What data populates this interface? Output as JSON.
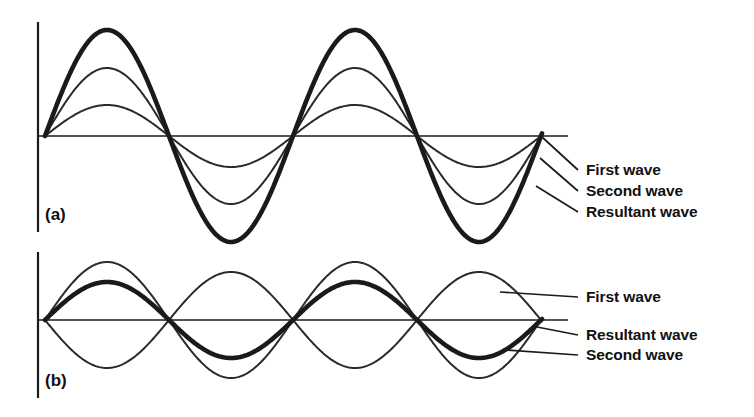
{
  "figure": {
    "background_color": "#ffffff",
    "stroke_color": "#1a1a1a"
  },
  "panels": [
    {
      "id": "a",
      "tag": "(a)",
      "interference_type": "constructive",
      "origin_x": 45,
      "baseline_y": 136,
      "axis_x": 38,
      "axis_top_y": 22,
      "axis_bottom_y": 232,
      "baseline_end_x": 568,
      "wave_end_x": 542,
      "period_px": 248,
      "callouts": [
        {
          "label": "First wave",
          "text_x": 586,
          "text_y": 175,
          "anchor_x": 542,
          "anchor_y": 137,
          "leader_end_x": 578,
          "leader_end_y": 170
        },
        {
          "label": "Second wave",
          "text_x": 586,
          "text_y": 196,
          "anchor_x": 540,
          "anchor_y": 158,
          "leader_end_x": 578,
          "leader_end_y": 191
        },
        {
          "label": "Resultant wave",
          "text_x": 586,
          "text_y": 217,
          "anchor_x": 536,
          "anchor_y": 186,
          "leader_end_x": 578,
          "leader_end_y": 212
        }
      ],
      "waves": [
        {
          "name": "first-wave",
          "amplitude": 68,
          "phase": 0,
          "weight": "thin",
          "label": "First wave"
        },
        {
          "name": "second-wave",
          "amplitude": 31,
          "phase": 0,
          "weight": "thin",
          "label": "Second wave"
        },
        {
          "name": "resultant-wave",
          "amplitude": 106,
          "phase": 0,
          "weight": "thick",
          "label": "Resultant wave"
        }
      ]
    },
    {
      "id": "b",
      "tag": "(b)",
      "interference_type": "destructive",
      "origin_x": 45,
      "baseline_y": 320,
      "axis_x": 38,
      "axis_top_y": 252,
      "axis_bottom_y": 398,
      "baseline_end_x": 568,
      "wave_end_x": 542,
      "period_px": 248,
      "callouts": [
        {
          "label": "First wave",
          "text_x": 586,
          "text_y": 302,
          "anchor_x": 500,
          "anchor_y": 292,
          "leader_end_x": 578,
          "leader_end_y": 297
        },
        {
          "label": "Resultant wave",
          "text_x": 586,
          "text_y": 340,
          "anchor_x": 537,
          "anchor_y": 327,
          "leader_end_x": 578,
          "leader_end_y": 335
        },
        {
          "label": "Second wave",
          "text_x": 586,
          "text_y": 360,
          "anchor_x": 505,
          "anchor_y": 350,
          "leader_end_x": 578,
          "leader_end_y": 355
        }
      ],
      "waves": [
        {
          "name": "first-wave",
          "amplitude": 58,
          "phase": 0,
          "weight": "thin",
          "label": "First wave"
        },
        {
          "name": "second-wave",
          "amplitude": -48,
          "phase": 0,
          "weight": "thin",
          "label": "Second wave"
        },
        {
          "name": "resultant-wave",
          "amplitude": 38,
          "phase": 0,
          "weight": "thick",
          "label": "Resultant wave"
        }
      ]
    }
  ],
  "chart_data": {
    "type": "line",
    "xlabel": "",
    "ylabel": "",
    "grid": false,
    "legend_position": "right-callouts",
    "panels": [
      {
        "panel": "(a)",
        "description": "Constructive interference: two in-phase sine waves add to a larger resultant.",
        "cycles": 2,
        "series": [
          {
            "name": "First wave",
            "amplitude": 68,
            "phase_deg": 0,
            "line_weight": "thin"
          },
          {
            "name": "Second wave",
            "amplitude": 31,
            "phase_deg": 0,
            "line_weight": "thin"
          },
          {
            "name": "Resultant wave",
            "amplitude": 106,
            "phase_deg": 0,
            "line_weight": "thick"
          }
        ]
      },
      {
        "panel": "(b)",
        "description": "Destructive interference: two out-of-phase sine waves partially cancel to a smaller resultant.",
        "cycles": 2,
        "series": [
          {
            "name": "First wave",
            "amplitude": 58,
            "phase_deg": 0,
            "line_weight": "thin"
          },
          {
            "name": "Second wave",
            "amplitude": 48,
            "phase_deg": 180,
            "line_weight": "thin"
          },
          {
            "name": "Resultant wave",
            "amplitude": 38,
            "phase_deg": 0,
            "line_weight": "thick"
          }
        ]
      }
    ]
  }
}
